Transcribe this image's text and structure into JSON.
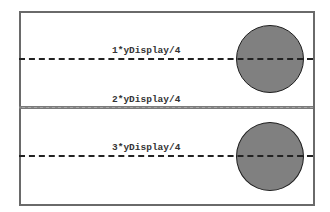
{
  "diagram": {
    "frame": {
      "left": 19,
      "top": 11,
      "right": 313,
      "bottom": 204,
      "border_color": "#6a6a6a"
    },
    "lines": [
      {
        "label": "1*yDisplay/4",
        "y": 59,
        "style": "dashed"
      },
      {
        "label": "2*yDisplay/4",
        "y": 107,
        "style": "solid-gray"
      },
      {
        "label": "3*yDisplay/4",
        "y": 156,
        "style": "dashed"
      }
    ],
    "circles": [
      {
        "cx": 270,
        "cy": 59,
        "r": 34,
        "fill": "#808080",
        "stroke": "#1e1e1e"
      },
      {
        "cx": 270,
        "cy": 156,
        "r": 34,
        "fill": "#808080",
        "stroke": "#1e1e1e"
      }
    ]
  }
}
